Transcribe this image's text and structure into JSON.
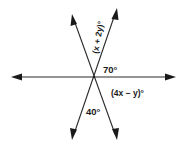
{
  "diagram": {
    "type": "intersecting-lines",
    "line_count": 3,
    "labels": {
      "upper_angle": "(x + 2y)°",
      "right_upper_angle": "70°",
      "right_lower_angle": "(4x − y)°",
      "lower_angle": "40°"
    },
    "colors": {
      "background": "#ffffff",
      "ink": "#1a1a1a"
    }
  }
}
